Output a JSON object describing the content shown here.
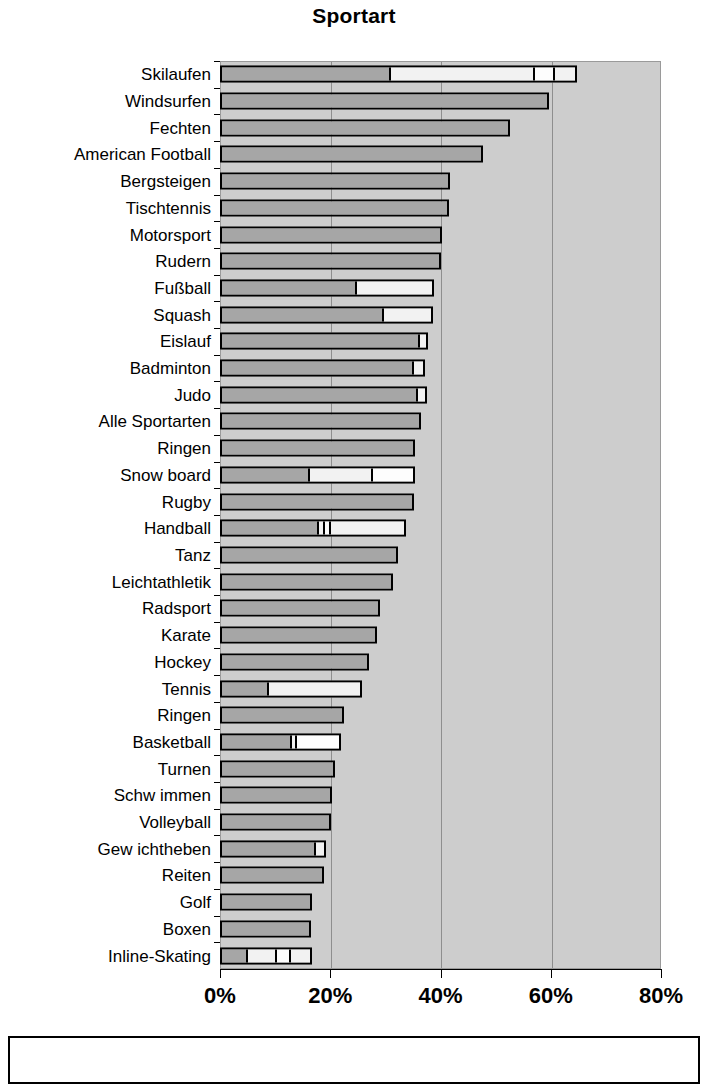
{
  "chart_data": {
    "type": "bar",
    "orientation": "horizontal",
    "stacked": true,
    "title": "Sportart",
    "xlabel": "",
    "ylabel": "",
    "xlim": [
      0,
      80
    ],
    "xticks": [
      0,
      20,
      40,
      60,
      80
    ],
    "xtick_labels": [
      "0%",
      "20%",
      "40%",
      "60%",
      "80%"
    ],
    "grid": "vertical",
    "legend": "none",
    "value_unit": "%",
    "categories": [
      "Skilaufen",
      "Windsurfen",
      "Fechten",
      "American Football",
      "Bergsteigen",
      "Tischtennis",
      "Motorsport",
      "Rudern",
      "Fußball",
      "Squash",
      "Eislauf",
      "Badminton",
      "Judo",
      "Alle Sportarten",
      "Ringen",
      "Snow board",
      "Rugby",
      "Handball",
      "Tanz",
      "Leichtathletik",
      "Radsport",
      "Karate",
      "Hockey",
      "Tennis",
      "Ringen",
      "Basketball",
      "Turnen",
      "Schw immen",
      "Volleyball",
      "Gew ichtheben",
      "Reiten",
      "Golf",
      "Boxen",
      "Inline-Skating"
    ],
    "values": [
      64.8,
      59.6,
      52.6,
      47.8,
      41.8,
      41.5,
      40.3,
      40.0,
      38.8,
      38.6,
      37.8,
      37.2,
      37.5,
      36.5,
      35.3,
      35.4,
      35.2,
      33.8,
      32.3,
      31.3,
      29.0,
      28.4,
      27.0,
      25.7,
      22.5,
      22.0,
      20.8,
      20.4,
      20.2,
      19.2,
      18.8,
      16.6,
      16.5,
      16.7
    ],
    "series_segments": [
      {
        "category": "Skilaufen",
        "segments": [
          31.0,
          26.5,
          3.5,
          3.8
        ]
      },
      {
        "category": "Windsurfen",
        "segments": [
          59.6
        ]
      },
      {
        "category": "Fechten",
        "segments": [
          52.6
        ]
      },
      {
        "category": "American Football",
        "segments": [
          47.8
        ]
      },
      {
        "category": "Bergsteigen",
        "segments": [
          41.8
        ]
      },
      {
        "category": "Tischtennis",
        "segments": [
          41.5
        ]
      },
      {
        "category": "Motorsport",
        "segments": [
          40.3
        ]
      },
      {
        "category": "Rudern",
        "segments": [
          40.0
        ]
      },
      {
        "category": "Fußball",
        "segments": [
          25.0,
          13.8
        ]
      },
      {
        "category": "Squash",
        "segments": [
          30.0,
          8.6
        ]
      },
      {
        "category": "Eislauf",
        "segments": [
          36.6,
          1.2
        ]
      },
      {
        "category": "Badminton",
        "segments": [
          35.6,
          1.6
        ]
      },
      {
        "category": "Judo",
        "segments": [
          36.3,
          1.2
        ]
      },
      {
        "category": "Alle Sportarten",
        "segments": [
          36.5
        ]
      },
      {
        "category": "Ringen",
        "segments": [
          35.3
        ]
      },
      {
        "category": "Snow board",
        "segments": [
          16.3,
          11.7,
          7.4
        ]
      },
      {
        "category": "Rugby",
        "segments": [
          35.2
        ]
      },
      {
        "category": "Handball",
        "segments": [
          18.0,
          1.0,
          1.2,
          13.6
        ]
      },
      {
        "category": "Tanz",
        "segments": [
          32.3
        ]
      },
      {
        "category": "Leichtathletik",
        "segments": [
          31.3
        ]
      },
      {
        "category": "Radsport",
        "segments": [
          29.0
        ]
      },
      {
        "category": "Karate",
        "segments": [
          28.4
        ]
      },
      {
        "category": "Hockey",
        "segments": [
          27.0
        ]
      },
      {
        "category": "Tennis",
        "segments": [
          8.7,
          17.0
        ]
      },
      {
        "category": "Ringen",
        "segments": [
          22.5
        ]
      },
      {
        "category": "Basketball",
        "segments": [
          13.2,
          0.8,
          8.0
        ]
      },
      {
        "category": "Turnen",
        "segments": [
          20.8
        ]
      },
      {
        "category": "Schw immen",
        "segments": [
          20.4
        ]
      },
      {
        "category": "Volleyball",
        "segments": [
          20.2
        ]
      },
      {
        "category": "Gew ichtheben",
        "segments": [
          17.8,
          1.4
        ]
      },
      {
        "category": "Reiten",
        "segments": [
          18.8
        ]
      },
      {
        "category": "Golf",
        "segments": [
          16.6
        ]
      },
      {
        "category": "Boxen",
        "segments": [
          16.5
        ]
      },
      {
        "category": "Inline-Skating",
        "segments": [
          5.0,
          5.5,
          2.6,
          3.6
        ]
      }
    ],
    "colors": {
      "plot_background": "#cdcdcd",
      "bar_primary": "#a6a6a6",
      "bar_secondary": "#f2f2f2",
      "bar_outline": "#000000",
      "gridline": "#8e8e8e",
      "text": "#000000"
    }
  }
}
